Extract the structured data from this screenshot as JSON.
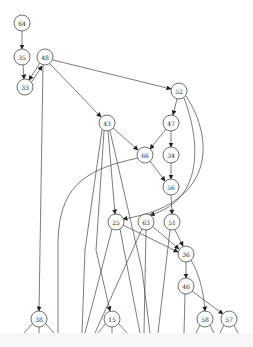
{
  "diagram": {
    "type": "directed-graph",
    "nodes": [
      {
        "id": "64",
        "label": "64",
        "x": 22,
        "y": 23
      },
      {
        "id": "35",
        "label": "35",
        "x": 22,
        "y": 57
      },
      {
        "id": "48",
        "label": "48",
        "x": 45,
        "y": 57
      },
      {
        "id": "33",
        "label": "33",
        "x": 25,
        "y": 87
      },
      {
        "id": "52",
        "label": "52",
        "x": 179,
        "y": 91
      },
      {
        "id": "43",
        "label": "43",
        "x": 107,
        "y": 123
      },
      {
        "id": "47",
        "label": "47",
        "x": 171,
        "y": 123
      },
      {
        "id": "66",
        "label": "66",
        "x": 145,
        "y": 155
      },
      {
        "id": "34",
        "label": "34",
        "x": 171,
        "y": 155
      },
      {
        "id": "56",
        "label": "56",
        "x": 171,
        "y": 187
      },
      {
        "id": "25",
        "label": "25",
        "x": 116,
        "y": 222
      },
      {
        "id": "63",
        "label": "63",
        "x": 146,
        "y": 222
      },
      {
        "id": "51",
        "label": "51",
        "x": 172,
        "y": 222
      },
      {
        "id": "36",
        "label": "36",
        "x": 186,
        "y": 254
      },
      {
        "id": "46",
        "label": "46",
        "x": 186,
        "y": 286
      },
      {
        "id": "38",
        "label": "38",
        "x": 39,
        "y": 319
      },
      {
        "id": "15",
        "label": "15",
        "x": 112,
        "y": 319
      },
      {
        "id": "58",
        "label": "58",
        "x": 205,
        "y": 319
      },
      {
        "id": "57",
        "label": "57",
        "x": 229,
        "y": 319
      }
    ]
  }
}
